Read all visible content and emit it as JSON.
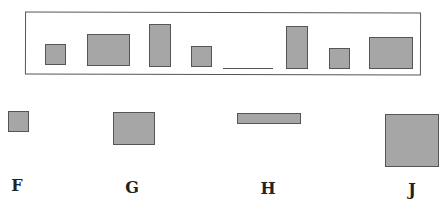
{
  "sequence": {
    "description": "Pattern of rectangles with one missing item",
    "items": [
      {
        "type": "shape",
        "kind": "small-square",
        "x": 45,
        "y": 44,
        "w": 21,
        "h": 21
      },
      {
        "type": "shape",
        "kind": "wide-rectangle",
        "x": 87,
        "y": 34,
        "w": 43,
        "h": 32
      },
      {
        "type": "shape",
        "kind": "tall-rectangle",
        "x": 149,
        "y": 24,
        "w": 22,
        "h": 43
      },
      {
        "type": "shape",
        "kind": "small-square",
        "x": 191,
        "y": 46,
        "w": 21,
        "h": 21
      },
      {
        "type": "blank",
        "kind": "missing-item",
        "x": 223,
        "y": 68,
        "w": 50
      },
      {
        "type": "shape",
        "kind": "tall-rectangle",
        "x": 286,
        "y": 26,
        "w": 22,
        "h": 43
      },
      {
        "type": "shape",
        "kind": "small-square",
        "x": 329,
        "y": 48,
        "w": 21,
        "h": 21
      },
      {
        "type": "shape",
        "kind": "wide-rectangle",
        "x": 369,
        "y": 37,
        "w": 44,
        "h": 32
      }
    ]
  },
  "choices": [
    {
      "label": "F",
      "kind": "small-square",
      "x": 8,
      "y": 111,
      "w": 21,
      "h": 21,
      "label_x": 17,
      "label_y": 178
    },
    {
      "label": "G",
      "kind": "wide-rectangle",
      "x": 113,
      "y": 112,
      "w": 42,
      "h": 33,
      "label_x": 132,
      "label_y": 180
    },
    {
      "label": "H",
      "kind": "flat-rectangle",
      "x": 237,
      "y": 113,
      "w": 64,
      "h": 11,
      "label_x": 268,
      "label_y": 181
    },
    {
      "label": "J",
      "kind": "large-square",
      "x": 385,
      "y": 114,
      "w": 54,
      "h": 53,
      "label_x": 412,
      "label_y": 182
    }
  ],
  "colors": {
    "fill": "#a6a6a6",
    "stroke": "#555555",
    "label": "#222222"
  }
}
